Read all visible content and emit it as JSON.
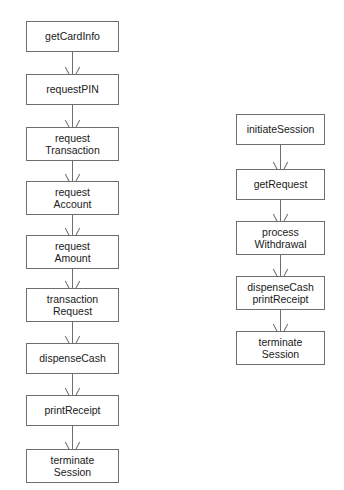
{
  "diagram": {
    "type": "flowchart",
    "orientation": "vertical",
    "background_color": "#ffffff",
    "box_border_color": "#6e6e6e",
    "text_color": "#1a1a1a",
    "arrow_style": "open-v-arrowhead",
    "columns": [
      {
        "id": "left-sequence",
        "nodes": [
          {
            "lines": [
              "getCardInfo"
            ]
          },
          {
            "lines": [
              "requestPIN"
            ]
          },
          {
            "lines": [
              "request",
              "Transaction"
            ]
          },
          {
            "lines": [
              "request",
              "Account"
            ]
          },
          {
            "lines": [
              "request",
              "Amount"
            ]
          },
          {
            "lines": [
              "transaction",
              "Request"
            ]
          },
          {
            "lines": [
              "dispenseCash"
            ]
          },
          {
            "lines": [
              "printReceipt"
            ]
          },
          {
            "lines": [
              "terminate",
              "Session"
            ]
          }
        ]
      },
      {
        "id": "right-sequence",
        "nodes": [
          {
            "lines": [
              "initiateSession"
            ]
          },
          {
            "lines": [
              "getRequest"
            ]
          },
          {
            "lines": [
              "process",
              "Withdrawal"
            ]
          },
          {
            "lines": [
              "dispenseCash",
              "printReceipt"
            ]
          },
          {
            "lines": [
              "terminate",
              "Session"
            ]
          }
        ]
      }
    ]
  }
}
